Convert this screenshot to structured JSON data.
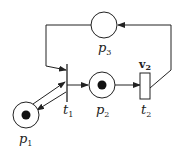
{
  "diagram": {
    "type": "petri-net",
    "places": [
      {
        "id": "p1",
        "label": "p",
        "sub": "1",
        "tokens": 1
      },
      {
        "id": "p2",
        "label": "p",
        "sub": "2",
        "tokens": 1
      },
      {
        "id": "p3",
        "label": "p",
        "sub": "3",
        "tokens": 0
      }
    ],
    "transitions": [
      {
        "id": "t1",
        "label": "t",
        "sub": "1"
      },
      {
        "id": "t2",
        "label": "t",
        "sub": "2",
        "annotation": "v",
        "annotation_sub": "2"
      }
    ],
    "arcs": [
      {
        "from": "p1",
        "to": "t1"
      },
      {
        "from": "t1",
        "to": "p1"
      },
      {
        "from": "p3",
        "to": "t1"
      },
      {
        "from": "t1",
        "to": "p2"
      },
      {
        "from": "p2",
        "to": "t2"
      },
      {
        "from": "t2",
        "to": "p3"
      }
    ]
  }
}
